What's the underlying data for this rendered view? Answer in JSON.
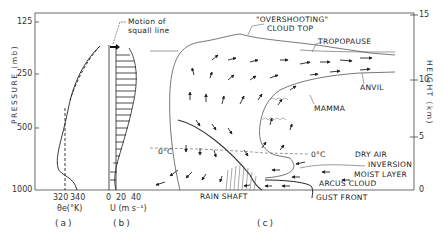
{
  "figure": {
    "panels": [
      {
        "id": "a",
        "label": "(a)",
        "xlabel": "θe(°K)",
        "xticks": [
          "320",
          "340"
        ]
      },
      {
        "id": "b",
        "label": "(b)",
        "xlabel": "U (m s⁻¹)",
        "xticks": [
          "0",
          "20",
          "40"
        ],
        "annotation": "Motion of squall line"
      },
      {
        "id": "c",
        "label": "(c)"
      }
    ],
    "left_axis": {
      "label": "PRESSURE (mb)",
      "ticks": [
        "125",
        "250",
        "500",
        "1000"
      ]
    },
    "right_axis": {
      "label": "HEIGHT (km)",
      "ticks": [
        "15",
        "10",
        "5",
        "0"
      ]
    },
    "annotations": {
      "overshooting": "\"OVERSHOOTING\"",
      "cloud_top": "CLOUD TOP",
      "tropopause": "TROPOPAUSE",
      "anvil": "ANVIL",
      "mamma": "MAMMA",
      "zero_c_left": "0°C",
      "zero_c_right": "0°C",
      "dry_air": "DRY AIR",
      "inversion": "INVERSION",
      "moist_layer": "MOIST LAYER",
      "arcus_cloud": "ARCUS CLOUD",
      "rain_shaft": "RAIN SHAFT",
      "gust_front": "GUST FRONT"
    },
    "colors": {
      "ink": "#222222",
      "background": "#ffffff",
      "shade": "#555555"
    }
  }
}
